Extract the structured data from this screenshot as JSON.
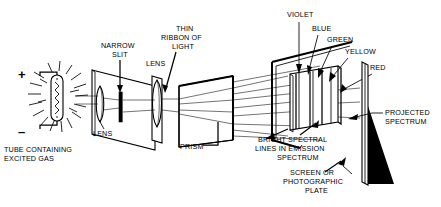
{
  "figure": {
    "background_color": "#ffffff",
    "ink_color": "#000000"
  },
  "labels": {
    "tube": "TUBE CONTAINING\nEXCITED GAS",
    "tube_line1": "TUBE CONTAINING",
    "tube_line2": "EXCITED GAS",
    "plus_sign": "+",
    "minus_sign": "–",
    "lens_left": "LENS",
    "lens_right": "LENS",
    "narrow_slit_line1": "NARROW",
    "narrow_slit_line2": "SLIT",
    "thin_ribbon_line1": "THIN",
    "thin_ribbon_line2": "RIBBON OF",
    "thin_ribbon_line3": "LIGHT",
    "prism": "PRISM",
    "bright_line1": "BRIGHT SPECTRAL",
    "bright_line2": "LINES IN EMISSION",
    "bright_line3": "SPECTRUM",
    "projected_line1": "PROJECTED",
    "projected_line2": "SPECTRUM",
    "screen_line1": "SCREEN OR",
    "screen_line2": "PHOTOGRAPHIC",
    "screen_line3": "PLATE"
  },
  "colors": {
    "violet": "VIOLET",
    "blue": "BLUE",
    "green": "GREEN",
    "yellow": "YELLOW",
    "red": "RED"
  },
  "components": [
    "gas-discharge-tube",
    "collimating-lens",
    "narrow-slit",
    "focusing-lens",
    "prism",
    "spectrum-plane",
    "screen-photographic-plate"
  ]
}
